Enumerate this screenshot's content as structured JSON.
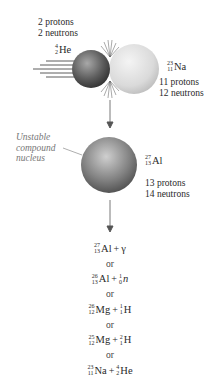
{
  "projectile": {
    "label_line1": "2 protons",
    "label_line2": "2 neutrons",
    "isotope": {
      "mass": "4",
      "atomic": "2",
      "symbol": "He"
    },
    "color": "#5a5a5a"
  },
  "target": {
    "isotope": {
      "mass": "23",
      "atomic": "11",
      "symbol": "Na"
    },
    "label_line1": "11 protons",
    "label_line2": "12 neutrons",
    "color": "#d8d8d8"
  },
  "compound": {
    "annotation_line1": "Unstable",
    "annotation_line2": "compound",
    "annotation_line3": "nucleus",
    "isotope": {
      "mass": "27",
      "atomic": "13",
      "symbol": "Al"
    },
    "label_line1": "13 protons",
    "label_line2": "14 neutrons",
    "color": "#7a7a7a"
  },
  "products": {
    "separator": "or",
    "options": [
      {
        "a": {
          "mass": "27",
          "atomic": "13",
          "symbol": "Al"
        },
        "plus": "+",
        "b_text": "γ"
      },
      {
        "a": {
          "mass": "26",
          "atomic": "13",
          "symbol": "Al"
        },
        "plus": "+",
        "b": {
          "mass": "1",
          "atomic": "0",
          "symbol": "n"
        }
      },
      {
        "a": {
          "mass": "26",
          "atomic": "12",
          "symbol": "Mg"
        },
        "plus": "+",
        "b": {
          "mass": "1",
          "atomic": "1",
          "symbol": "H"
        }
      },
      {
        "a": {
          "mass": "25",
          "atomic": "12",
          "symbol": "Mg"
        },
        "plus": "+",
        "b": {
          "mass": "2",
          "atomic": "1",
          "symbol": "H"
        }
      },
      {
        "a": {
          "mass": "23",
          "atomic": "11",
          "symbol": "Na"
        },
        "plus": "+",
        "b": {
          "mass": "4",
          "atomic": "2",
          "symbol": "He"
        }
      }
    ]
  }
}
